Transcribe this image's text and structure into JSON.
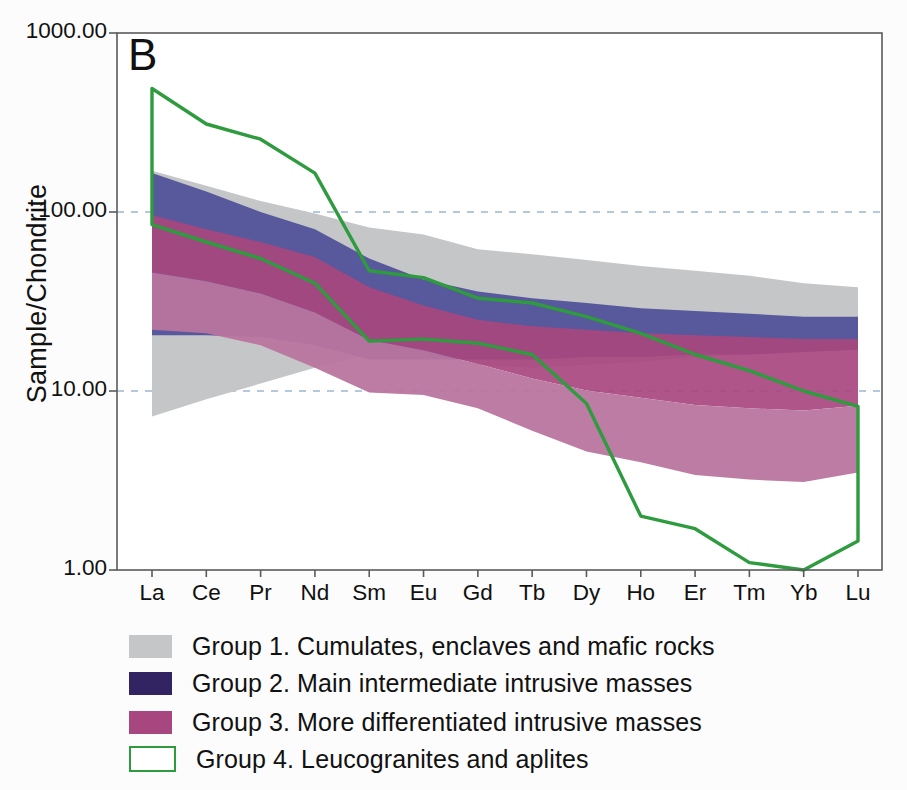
{
  "panel": {
    "letter": "B"
  },
  "axes": {
    "ylabel": "Sample/Chondrite",
    "yticks": [
      "1000.00",
      "100.00",
      "10.00",
      "1.00"
    ],
    "ytick_values": [
      1000,
      100,
      10,
      1
    ],
    "xticks": [
      "La",
      "Ce",
      "Pr",
      "Nd",
      "Sm",
      "Eu",
      "Gd",
      "Tb",
      "Dy",
      "Ho",
      "Er",
      "Tm",
      "Yb",
      "Lu"
    ]
  },
  "colors": {
    "group1": "#c5c6c7",
    "group2": "#58589c",
    "group2_swatch": "#322363",
    "group3": "#a8477f",
    "group3_light": "#b9759e",
    "group4_line": "#2e9b3e",
    "axis": "#4a4a4a",
    "gridline": "#9fb7cf",
    "plot_bg": "#ffffff"
  },
  "legend": {
    "items": [
      {
        "label": "Group 1. Cumulates, enclaves and mafic rocks",
        "swatch": "group1",
        "style": "fill"
      },
      {
        "label": "Group 2. Main intermediate intrusive masses",
        "swatch": "group2_swatch",
        "style": "fill"
      },
      {
        "label": "Group 3. More differentiated intrusive masses",
        "swatch": "group3",
        "style": "fill"
      },
      {
        "label": "Group 4. Leucogranites and aplites",
        "swatch": "group4_line",
        "style": "outline"
      }
    ]
  },
  "chart_data": {
    "type": "area",
    "title": "B",
    "xlabel": "",
    "ylabel": "Sample/Chondrite",
    "yscale": "log",
    "ylim": [
      1,
      1000
    ],
    "grid": true,
    "legend_position": "below",
    "categories": [
      "La",
      "Ce",
      "Pr",
      "Nd",
      "Sm",
      "Eu",
      "Gd",
      "Tb",
      "Dy",
      "Ho",
      "Er",
      "Tm",
      "Yb",
      "Lu"
    ],
    "series": [
      {
        "name": "Group 1. Cumulates, enclaves and mafic rocks",
        "type": "band",
        "color": "#c5c6c7",
        "upper": [
          170,
          140,
          115,
          98,
          82,
          75,
          62,
          58,
          54,
          50,
          47,
          44,
          40,
          38
        ],
        "lower": [
          7.2,
          9.0,
          11.0,
          13.5,
          16.0,
          17.5,
          14.0,
          13.5,
          14.0,
          14.5,
          15.5,
          16.0,
          16.5,
          17.0
        ]
      },
      {
        "name": "Group 2. Main intermediate intrusive masses",
        "type": "band",
        "color": "#58589c",
        "upper": [
          165,
          130,
          100,
          80,
          55,
          42,
          36,
          33,
          31,
          29,
          28,
          27,
          26,
          26
        ],
        "lower": [
          20.5,
          20.5,
          20.0,
          18.0,
          15.0,
          15.0,
          15.0,
          15.0,
          15.5,
          15.5,
          16.0,
          16.0,
          16.5,
          17.0
        ]
      },
      {
        "name": "Group 3. More differentiated intrusive masses",
        "type": "band",
        "color": "#a8477f",
        "upper": [
          96,
          80,
          68,
          56,
          38,
          30,
          25,
          23,
          22,
          21,
          20.5,
          20.0,
          19.5,
          19.5
        ],
        "lower": [
          22,
          21,
          18,
          13.5,
          9.8,
          9.5,
          8.0,
          6.0,
          4.6,
          4.0,
          3.4,
          3.2,
          3.1,
          3.5
        ]
      },
      {
        "name": "Group 4. Leucogranites and aplites",
        "type": "envelope",
        "color": "#2e9b3e",
        "upper": [
          490,
          310,
          255,
          165,
          47,
          43,
          33,
          31,
          26,
          21,
          16,
          13,
          10,
          8.2
        ],
        "lower": [
          85,
          68,
          55,
          40,
          19,
          19.5,
          18.5,
          16.0,
          8.5,
          2.0,
          1.7,
          1.1,
          1.0,
          1.45
        ]
      }
    ]
  }
}
